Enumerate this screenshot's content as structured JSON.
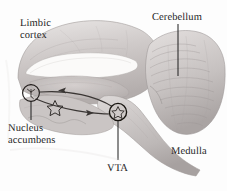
{
  "figure": {
    "name": "brain-reward-pathway-sagittal-diagram",
    "background_color": "#fdfdfd",
    "ink_color": "#1c1c1c",
    "tissue_color": "#b9b4b3",
    "width": 227,
    "height": 191
  },
  "labels": {
    "limbic_cortex": "Limbic\ncortex",
    "cerebellum": "Cerebellum",
    "nucleus_accumbens": "Nucleus\naccumbens",
    "vta": "VTA",
    "medulla": "Medulla"
  },
  "structures": [
    {
      "id": "limbic-cortex",
      "label": "Limbic cortex",
      "has_leader_line": false
    },
    {
      "id": "cerebellum",
      "label": "Cerebellum",
      "has_leader_line": true
    },
    {
      "id": "nucleus-accumbens",
      "label": "Nucleus accumbens",
      "has_leader_line": true
    },
    {
      "id": "vta",
      "label": "VTA",
      "has_leader_line": true
    },
    {
      "id": "medulla",
      "label": "Medulla",
      "has_leader_line": false
    }
  ],
  "markers": [
    {
      "id": "nucleus-accumbens-circle",
      "shape": "circled-neuron",
      "cx": 31,
      "cy": 93
    },
    {
      "id": "stellate-cell-star",
      "shape": "star",
      "cx": 55,
      "cy": 108
    },
    {
      "id": "vta-circle",
      "shape": "circled-star",
      "cx": 118,
      "cy": 112
    }
  ],
  "pathways": [
    {
      "id": "vta-to-accumbens",
      "direction": "leftward",
      "from": "VTA",
      "to": "Nucleus accumbens",
      "arrow_glyph": "◄"
    },
    {
      "id": "accumbens-to-vta",
      "direction": "rightward",
      "from": "Nucleus accumbens",
      "to": "VTA",
      "arrow_glyph": "►"
    }
  ]
}
